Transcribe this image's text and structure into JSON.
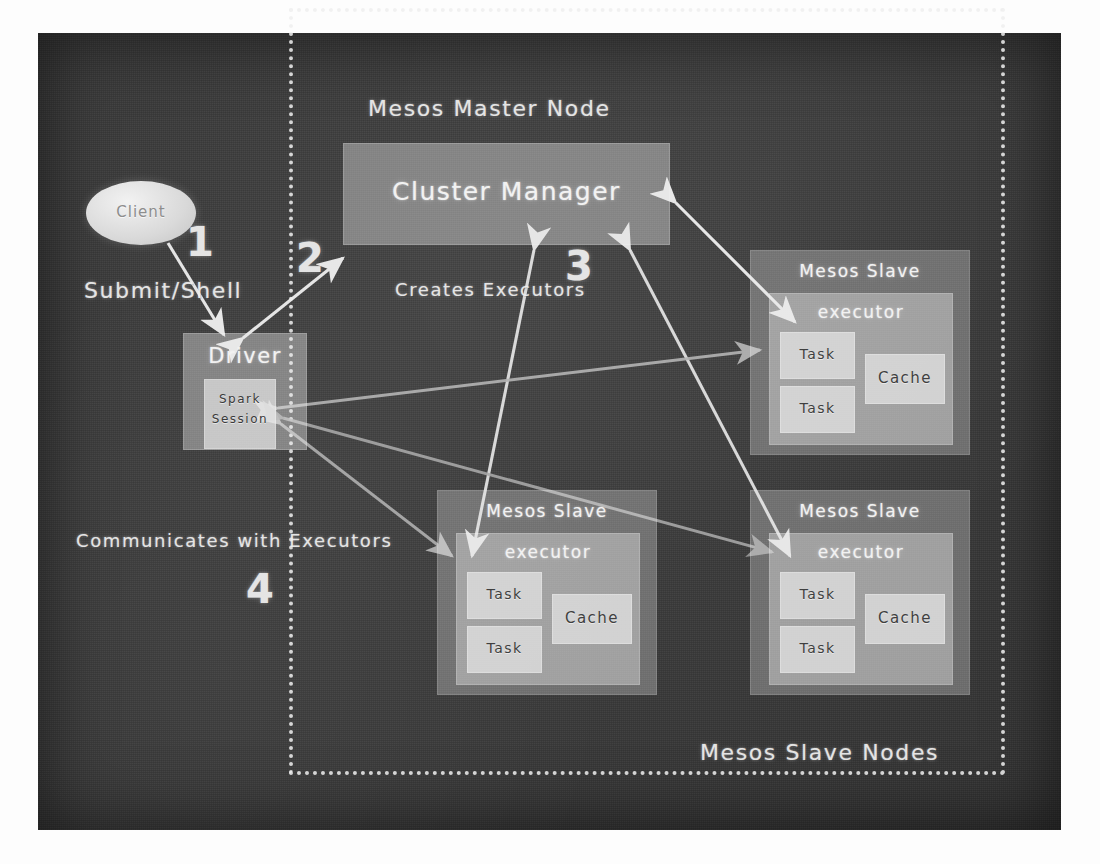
{
  "diagram": {
    "board_color": "#3a3a3a",
    "chalk_color": "#efefef"
  },
  "regions": {
    "master_label": "Mesos Master Node",
    "slaves_label": "Mesos Slave Nodes"
  },
  "nodes": {
    "client": "Client",
    "driver": "Driver",
    "spark_session": "Spark\nSession",
    "spark_session_line1": "Spark",
    "spark_session_line2": "Session",
    "cluster_manager": "Cluster Manager"
  },
  "slaves": [
    {
      "id": "slave-top-right",
      "title": "Mesos Slave",
      "executor": "executor",
      "tasks": [
        "Task",
        "Task"
      ],
      "cache": "Cache"
    },
    {
      "id": "slave-bottom-left",
      "title": "Mesos Slave",
      "executor": "executor",
      "tasks": [
        "Task",
        "Task"
      ],
      "cache": "Cache"
    },
    {
      "id": "slave-bottom-right",
      "title": "Mesos Slave",
      "executor": "executor",
      "tasks": [
        "Task",
        "Task"
      ],
      "cache": "Cache"
    }
  ],
  "annotations": {
    "step1_number": "1",
    "step1_label": "Submit/Shell",
    "step2_number": "2",
    "step3_number": "3",
    "step3_label": "Creates Executors",
    "step4_number": "4",
    "step4_label": "Communicates with Executors"
  }
}
